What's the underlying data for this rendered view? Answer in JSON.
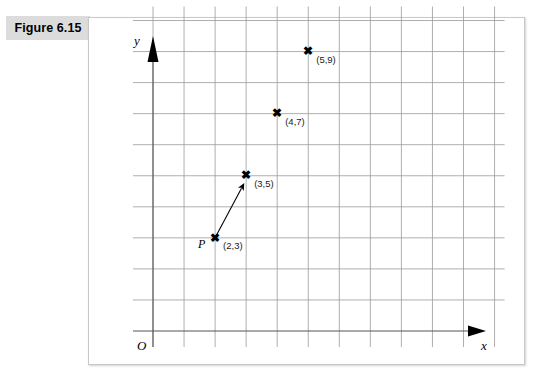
{
  "figure": {
    "label": "Figure 6.15"
  },
  "chart_data": {
    "type": "scatter",
    "title": "Figure 6.15",
    "xlabel": "x",
    "ylabel": "y",
    "grid": true,
    "legend": false,
    "origin_label": "O",
    "xlim": [
      0,
      11
    ],
    "ylim": [
      0,
      10
    ],
    "grid_step": 1,
    "points": [
      {
        "name": "P",
        "label": "(2,3)",
        "x": 2,
        "y": 3,
        "marker": "x",
        "show_name": true
      },
      {
        "name": "",
        "label": "(3,5)",
        "x": 3,
        "y": 5,
        "marker": "x",
        "show_name": false
      },
      {
        "name": "",
        "label": "(4,7)",
        "x": 4,
        "y": 7,
        "marker": "x",
        "show_name": false
      },
      {
        "name": "",
        "label": "(5,9)",
        "x": 5,
        "y": 9,
        "marker": "x",
        "show_name": false
      }
    ],
    "vector": {
      "from": [
        2,
        3
      ],
      "to": [
        2.85,
        4.6
      ],
      "has_arrowhead": true
    },
    "marker_glyph": "✖",
    "colors": {
      "grid": "#9a9a9a",
      "axis": "#555555",
      "marker": "#000000",
      "text": "#000000",
      "label_band": "#dcdcdc",
      "panel_border": "#c8c8c8"
    }
  }
}
